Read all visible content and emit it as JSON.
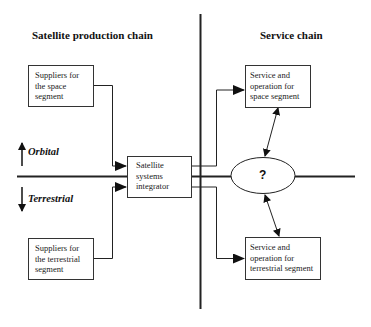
{
  "headings": {
    "left": "Satellite production chain",
    "right": "Service chain"
  },
  "boxes": {
    "suppliers_space": "Suppliers  for the space segment",
    "suppliers_terrestrial": "Suppliers  for the terrestrial segment",
    "integrator": "Satellite systems integrator",
    "service_space": "Service and operation for space segment",
    "service_terrestrial": "Service and operation for terrestrial segment"
  },
  "axis": {
    "up_label": "Orbital",
    "down_label": "Terrestrial"
  },
  "ellipse": {
    "label": "?"
  },
  "colors": {
    "line": "#222222",
    "background": "#ffffff"
  }
}
